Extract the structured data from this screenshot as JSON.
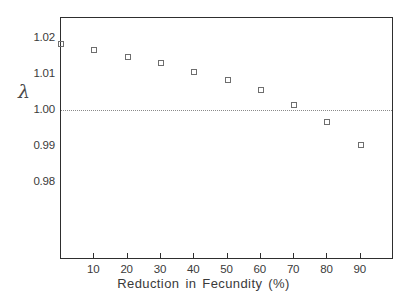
{
  "chart_data": {
    "type": "scatter",
    "title": "",
    "xlabel": "Reduction in Fecundity (%)",
    "ylabel": "λ",
    "ylabel_name": "lambda",
    "x": [
      0,
      10,
      20,
      30,
      40,
      50,
      60,
      70,
      80,
      90
    ],
    "values": [
      1.0183,
      1.0167,
      1.0147,
      1.0131,
      1.0106,
      1.0083,
      1.0056,
      1.0014,
      0.9967,
      0.9903
    ],
    "xlim": [
      0,
      100
    ],
    "ylim": [
      0.9585,
      1.0255
    ],
    "xticks": [
      10,
      20,
      30,
      40,
      50,
      60,
      70,
      80,
      90
    ],
    "xtick_labels": [
      "10",
      "20",
      "30",
      "40",
      "50",
      "60",
      "70",
      "80",
      "90"
    ],
    "yticks": [
      1.02,
      1.01,
      1.0,
      0.99,
      0.98
    ],
    "ytick_labels": [
      "1.02",
      "1.01",
      "1.00",
      "0.99",
      "0.98"
    ],
    "grid": false,
    "legend": null,
    "annotations": [
      {
        "name": "reference-line",
        "type": "horizontal-line",
        "y": 1.0,
        "style": "dotted"
      }
    ],
    "marker": {
      "shape": "open-square",
      "color": "#6e6e6e",
      "size": 6
    },
    "colors": {
      "axis": "#2e2e2e",
      "marker": "#6e6e6e",
      "reference_line": "#8a8a8a",
      "text": "#3a3a3a",
      "background": "#ffffff"
    }
  }
}
